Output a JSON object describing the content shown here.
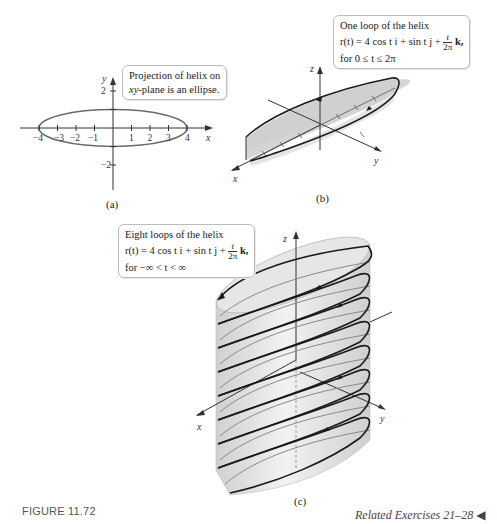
{
  "page": {
    "top_cut_text": "which are shown in Figure 11.72",
    "figure_caption": "FIGURE 11.72",
    "related_exercises": "Related Exercises 21–28",
    "related_marker": "◀"
  },
  "panel_a": {
    "label": "(a)",
    "callout_line1": "Projection of helix on",
    "callout_line2_var": "xy",
    "callout_line2_rest": "-plane is an ellipse.",
    "x_axis_label": "x",
    "y_axis_label": "y",
    "x_ticks": [
      "−4",
      "−3",
      "−2",
      "−1",
      "1",
      "2",
      "3",
      "4"
    ],
    "y_ticks": [
      "2",
      "1",
      "−1",
      "−2"
    ],
    "ellipse": {
      "semi_major": 4,
      "semi_minor": 1
    }
  },
  "panel_b": {
    "label": "(b)",
    "callout_line1": "One loop of the helix",
    "eq_lhs": "r(t) = 4 cos t i + sin t j + ",
    "frac_num": "t",
    "frac_den": "2π",
    "eq_tail": " k,",
    "callout_line3": "for 0 ≤ t ≤ 2π",
    "x_axis_label": "x",
    "y_axis_label": "y",
    "z_axis_label": "z"
  },
  "panel_c": {
    "label": "(c)",
    "callout_line1": "Eight loops of the helix",
    "eq_lhs": "r(t) = 4 cos t i + sin t j + ",
    "frac_num": "t",
    "frac_den": "2π",
    "eq_tail": " k,",
    "callout_line3": "for −∞ < t < ∞",
    "x_axis_label": "x",
    "y_axis_label": "y",
    "z_axis_label": "z",
    "loops": 8
  },
  "colors": {
    "curve": "#1a1a1a",
    "surface": "#d9d9d9",
    "axis": "#333333",
    "ellipse": "#666666",
    "callout_border": "#bdbdbd"
  }
}
